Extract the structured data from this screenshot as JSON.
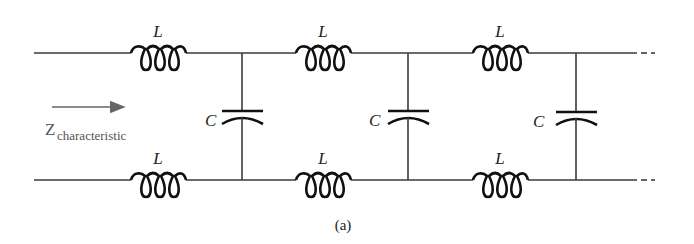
{
  "diagram": {
    "type": "lc-ladder-transmission-line",
    "caption": "(a)",
    "impedance_label": {
      "main": "Z",
      "subscript": "characteristic"
    },
    "inductors": [
      {
        "label": "L",
        "position": "top",
        "x": 158
      },
      {
        "label": "L",
        "position": "top",
        "x": 323
      },
      {
        "label": "L",
        "position": "top",
        "x": 500
      },
      {
        "label": "L",
        "position": "bottom",
        "x": 158
      },
      {
        "label": "L",
        "position": "bottom",
        "x": 323
      },
      {
        "label": "L",
        "position": "bottom",
        "x": 500
      }
    ],
    "capacitors": [
      {
        "label": "C",
        "x": 242
      },
      {
        "label": "C",
        "x": 408
      },
      {
        "label": "C",
        "x": 576
      }
    ],
    "continuation": "- -"
  }
}
